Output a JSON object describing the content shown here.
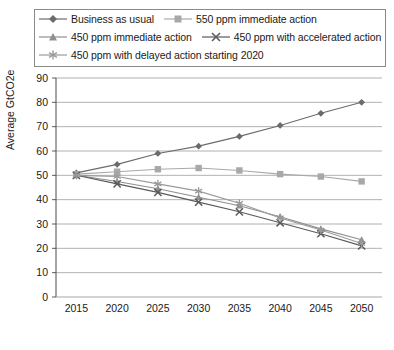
{
  "chart_data": {
    "type": "line",
    "title": "",
    "xlabel": "",
    "ylabel": "Average GtCO2e",
    "categories": [
      2015,
      2020,
      2025,
      2030,
      2035,
      2040,
      2045,
      2050
    ],
    "xlim": [
      2012.5,
      2052.5
    ],
    "ylim": [
      0,
      90
    ],
    "yticks": [
      0,
      10,
      20,
      30,
      40,
      50,
      60,
      70,
      80,
      90
    ],
    "xticks": [
      "2015",
      "2020",
      "2025",
      "2030",
      "2035",
      "2040",
      "2045",
      "2050"
    ],
    "grid": "horizontal",
    "legend_position": "top",
    "series": [
      {
        "name": "Business as usual",
        "marker": "diamond",
        "color": "#6b6b6b",
        "values": [
          51,
          54.5,
          59,
          62,
          66,
          70.5,
          75.5,
          80
        ]
      },
      {
        "name": "550 ppm immediate action",
        "marker": "square",
        "color": "#a8a8a8",
        "values": [
          50.5,
          51.5,
          52.5,
          53,
          52,
          50.5,
          49.5,
          47.5
        ]
      },
      {
        "name": "450 ppm immediate action",
        "marker": "triangle",
        "color": "#8f8f8f",
        "values": [
          50,
          47.5,
          44.5,
          41,
          37.5,
          33,
          28,
          23.5
        ]
      },
      {
        "name": "450 ppm with accelerated action",
        "marker": "x",
        "color": "#5a5a5a",
        "values": [
          50,
          46.5,
          43,
          39,
          35,
          30.5,
          26,
          21
        ]
      },
      {
        "name": "450 ppm with delayed action starting 2020",
        "marker": "asterisk",
        "color": "#9a9a9a",
        "values": [
          50,
          49.5,
          46.5,
          43.5,
          38.5,
          32.5,
          27.5,
          22
        ]
      }
    ]
  },
  "legend": {
    "items": [
      {
        "label": "Business as usual"
      },
      {
        "label": "550 ppm immediate action"
      },
      {
        "label": "450 ppm immediate action"
      },
      {
        "label": "450 ppm with accelerated action"
      },
      {
        "label": "450 ppm with delayed action starting 2020"
      }
    ]
  },
  "axes": {
    "y_label": "Average GtCO2e"
  },
  "caption": {
    "text": ""
  }
}
